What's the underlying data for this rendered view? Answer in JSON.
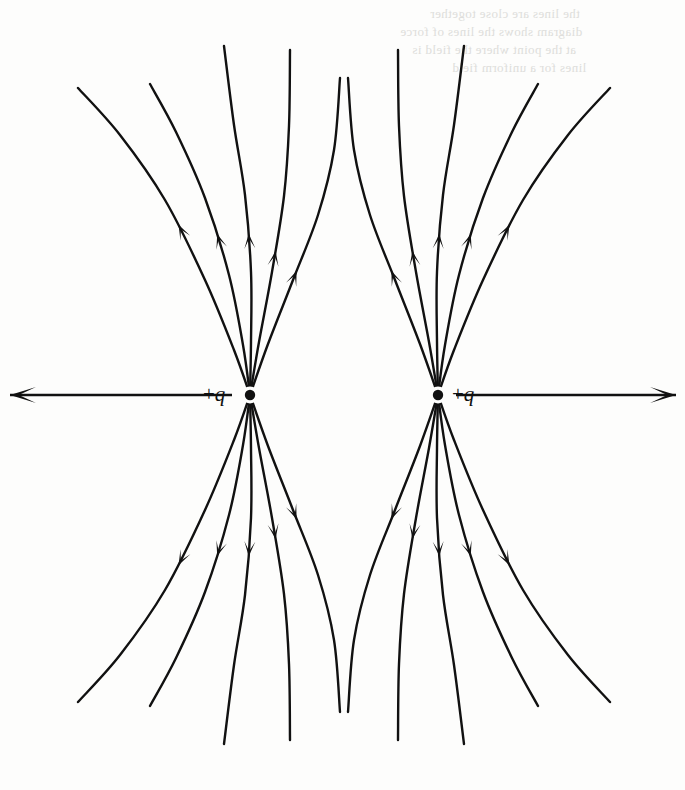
{
  "figure": {
    "kind": "electric-field-line-diagram",
    "background_color": "#fdfdfc",
    "ink_color": "#111111",
    "width": 685,
    "height": 790
  },
  "charges": [
    {
      "id": "left",
      "label_sign": "+",
      "label_symbol": "q",
      "label_text": "+q",
      "label_side": "left",
      "x": 250,
      "y": 395,
      "dot_radius": 5.2,
      "polarity": "positive"
    },
    {
      "id": "right",
      "label_sign": "+",
      "label_symbol": "q",
      "label_text": "+q",
      "label_side": "right",
      "x": 438,
      "y": 395,
      "dot_radius": 5.2,
      "polarity": "positive"
    }
  ],
  "axis": {
    "y": 395,
    "left_arrow": {
      "name": "axis-arrow-left",
      "from_x": 232,
      "to_x": 10,
      "direction": "left"
    },
    "right_arrow": {
      "name": "axis-arrow-right",
      "from_x": 456,
      "to_x": 676,
      "direction": "right"
    },
    "stroke_width": 2.6,
    "arrow_length": 26,
    "arrow_half_width": 8
  },
  "field_lines": {
    "stroke_width": 2.4,
    "arrowhead": {
      "length": 15,
      "half_width": 5.5
    },
    "direction": "outward-from-charges",
    "count_per_charge": 10,
    "note": "Five lines above and five below each charge; lines curve away from the opposite charge."
  },
  "chart_data": {
    "type": "line",
    "title": "",
    "subtitle": "",
    "xlabel": "",
    "ylabel": "",
    "grid": false,
    "legend": null,
    "annotations": [
      {
        "text": "+q",
        "x": 250,
        "y": 395,
        "anchor": "left-of-point"
      },
      {
        "text": "+q",
        "x": 438,
        "y": 395,
        "anchor": "right-of-point"
      }
    ],
    "series": [
      {
        "name": "left-charge-line-up-1",
        "charge": "left",
        "arrow_t": 0.52,
        "points": [
          [
            250,
            395
          ],
          [
            234,
            350
          ],
          [
            205,
            280
          ],
          [
            165,
            200
          ],
          [
            120,
            135
          ],
          [
            78,
            88
          ]
        ]
      },
      {
        "name": "left-charge-line-up-2",
        "charge": "left",
        "arrow_t": 0.5,
        "points": [
          [
            250,
            395
          ],
          [
            243,
            345
          ],
          [
            229,
            275
          ],
          [
            205,
            198
          ],
          [
            176,
            132
          ],
          [
            150,
            84
          ]
        ]
      },
      {
        "name": "left-charge-line-up-3",
        "charge": "left",
        "arrow_t": 0.46,
        "points": [
          [
            250,
            395
          ],
          [
            251,
            342
          ],
          [
            251,
            272
          ],
          [
            245,
            195
          ],
          [
            234,
            125
          ],
          [
            224,
            46
          ]
        ]
      },
      {
        "name": "left-charge-line-up-4",
        "charge": "left",
        "arrow_t": 0.42,
        "points": [
          [
            250,
            395
          ],
          [
            259,
            342
          ],
          [
            272,
            272
          ],
          [
            284,
            196
          ],
          [
            289,
            126
          ],
          [
            290,
            50
          ]
        ]
      },
      {
        "name": "left-charge-line-up-5",
        "charge": "left",
        "arrow_t": 0.4,
        "points": [
          [
            250,
            395
          ],
          [
            268,
            344
          ],
          [
            293,
            280
          ],
          [
            318,
            215
          ],
          [
            334,
            150
          ],
          [
            340,
            78
          ]
        ]
      },
      {
        "name": "left-charge-line-down-1",
        "charge": "left",
        "arrow_t": 0.52,
        "points": [
          [
            250,
            395
          ],
          [
            234,
            440
          ],
          [
            205,
            510
          ],
          [
            165,
            590
          ],
          [
            120,
            655
          ],
          [
            78,
            702
          ]
        ]
      },
      {
        "name": "left-charge-line-down-2",
        "charge": "left",
        "arrow_t": 0.5,
        "points": [
          [
            250,
            395
          ],
          [
            243,
            445
          ],
          [
            229,
            515
          ],
          [
            205,
            592
          ],
          [
            176,
            658
          ],
          [
            150,
            706
          ]
        ]
      },
      {
        "name": "left-charge-line-down-3",
        "charge": "left",
        "arrow_t": 0.46,
        "points": [
          [
            250,
            395
          ],
          [
            251,
            448
          ],
          [
            251,
            518
          ],
          [
            245,
            595
          ],
          [
            234,
            665
          ],
          [
            224,
            744
          ]
        ]
      },
      {
        "name": "left-charge-line-down-4",
        "charge": "left",
        "arrow_t": 0.42,
        "points": [
          [
            250,
            395
          ],
          [
            259,
            448
          ],
          [
            272,
            518
          ],
          [
            284,
            594
          ],
          [
            289,
            664
          ],
          [
            290,
            740
          ]
        ]
      },
      {
        "name": "left-charge-line-down-5",
        "charge": "left",
        "arrow_t": 0.4,
        "points": [
          [
            250,
            395
          ],
          [
            268,
            446
          ],
          [
            293,
            510
          ],
          [
            318,
            575
          ],
          [
            334,
            640
          ],
          [
            340,
            712
          ]
        ]
      },
      {
        "name": "right-charge-line-up-1",
        "charge": "right",
        "arrow_t": 0.52,
        "points": [
          [
            438,
            395
          ],
          [
            454,
            350
          ],
          [
            483,
            280
          ],
          [
            523,
            200
          ],
          [
            568,
            135
          ],
          [
            610,
            88
          ]
        ]
      },
      {
        "name": "right-charge-line-up-2",
        "charge": "right",
        "arrow_t": 0.5,
        "points": [
          [
            438,
            395
          ],
          [
            445,
            345
          ],
          [
            459,
            275
          ],
          [
            483,
            198
          ],
          [
            512,
            132
          ],
          [
            538,
            84
          ]
        ]
      },
      {
        "name": "right-charge-line-up-3",
        "charge": "right",
        "arrow_t": 0.46,
        "points": [
          [
            438,
            395
          ],
          [
            437,
            342
          ],
          [
            437,
            272
          ],
          [
            443,
            195
          ],
          [
            454,
            125
          ],
          [
            464,
            46
          ]
        ]
      },
      {
        "name": "right-charge-line-up-4",
        "charge": "right",
        "arrow_t": 0.42,
        "points": [
          [
            438,
            395
          ],
          [
            429,
            342
          ],
          [
            416,
            272
          ],
          [
            404,
            196
          ],
          [
            399,
            126
          ],
          [
            398,
            50
          ]
        ]
      },
      {
        "name": "right-charge-line-up-5",
        "charge": "right",
        "arrow_t": 0.4,
        "points": [
          [
            438,
            395
          ],
          [
            420,
            344
          ],
          [
            395,
            280
          ],
          [
            370,
            215
          ],
          [
            354,
            150
          ],
          [
            348,
            78
          ]
        ]
      },
      {
        "name": "right-charge-line-down-1",
        "charge": "right",
        "arrow_t": 0.52,
        "points": [
          [
            438,
            395
          ],
          [
            454,
            440
          ],
          [
            483,
            510
          ],
          [
            523,
            590
          ],
          [
            568,
            655
          ],
          [
            610,
            702
          ]
        ]
      },
      {
        "name": "right-charge-line-down-2",
        "charge": "right",
        "arrow_t": 0.5,
        "points": [
          [
            438,
            395
          ],
          [
            445,
            445
          ],
          [
            459,
            515
          ],
          [
            483,
            592
          ],
          [
            512,
            658
          ],
          [
            538,
            706
          ]
        ]
      },
      {
        "name": "right-charge-line-down-3",
        "charge": "right",
        "arrow_t": 0.46,
        "points": [
          [
            438,
            395
          ],
          [
            437,
            448
          ],
          [
            437,
            518
          ],
          [
            443,
            595
          ],
          [
            454,
            665
          ],
          [
            464,
            744
          ]
        ]
      },
      {
        "name": "right-charge-line-down-4",
        "charge": "right",
        "arrow_t": 0.42,
        "points": [
          [
            438,
            395
          ],
          [
            429,
            448
          ],
          [
            416,
            518
          ],
          [
            404,
            594
          ],
          [
            399,
            664
          ],
          [
            398,
            740
          ]
        ]
      },
      {
        "name": "right-charge-line-down-5",
        "charge": "right",
        "arrow_t": 0.4,
        "points": [
          [
            438,
            395
          ],
          [
            420,
            446
          ],
          [
            395,
            510
          ],
          [
            370,
            575
          ],
          [
            354,
            640
          ],
          [
            348,
            712
          ]
        ]
      }
    ]
  },
  "bleed_through": {
    "visible": true,
    "note": "Faint mirrored text showing through from the reverse side of the printed page; illegible.",
    "lines": [
      {
        "text": "the lines are close together",
        "x": 430,
        "y": 6
      },
      {
        "text": "diagram shows the lines of force",
        "x": 400,
        "y": 24
      },
      {
        "text": "at the point where the field is",
        "x": 412,
        "y": 42
      },
      {
        "text": "lines for a uniform field",
        "x": 452,
        "y": 60
      }
    ]
  }
}
